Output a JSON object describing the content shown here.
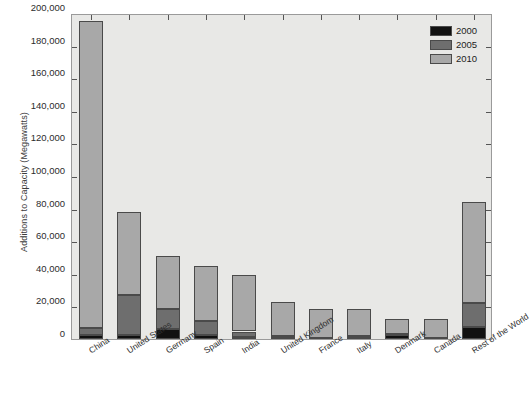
{
  "chart_data": {
    "type": "bar",
    "subtype": "stacked",
    "title": "",
    "xlabel": "",
    "ylabel": "Additions to Capacity (Megawatts)",
    "ylim": [
      0,
      200000
    ],
    "ytick_labels": [
      "0",
      "20,000",
      "40,000",
      "60,000",
      "80,000",
      "100,000",
      "120,000",
      "140,000",
      "160,000",
      "180,000",
      "200,000"
    ],
    "ytick_values": [
      0,
      20000,
      40000,
      60000,
      80000,
      100000,
      120000,
      140000,
      160000,
      180000,
      200000
    ],
    "grid": false,
    "legend_position": "top-right",
    "categories": [
      "China",
      "United States",
      "Germany",
      "Spain",
      "India",
      "United Kingdom",
      "France",
      "Italy",
      "Denmark",
      "Canada",
      "Rest of the World"
    ],
    "series": [
      {
        "name": "2000",
        "color": "#111111",
        "values": [
          2500,
          2500,
          6100,
          2200,
          1200,
          400,
          100,
          400,
          2400,
          150,
          7400
        ]
      },
      {
        "name": "2005",
        "color": "#6e6e6e",
        "values": [
          4000,
          24500,
          12300,
          8900,
          3400,
          1300,
          800,
          1300,
          800,
          500,
          14600
        ]
      },
      {
        "name": "2010",
        "color": "#a8a8a8",
        "values": [
          188500,
          51000,
          32600,
          33900,
          34400,
          21300,
          17600,
          16800,
          9300,
          11350,
          62000
        ]
      }
    ],
    "totals": [
      195000,
      78000,
      51000,
      45000,
      39000,
      23000,
      18500,
      18500,
      12500,
      12000,
      84000
    ]
  },
  "legend": {
    "items": [
      {
        "label": "2000",
        "color": "#111111"
      },
      {
        "label": "2005",
        "color": "#6e6e6e"
      },
      {
        "label": "2010",
        "color": "#a8a8a8"
      }
    ]
  },
  "style": {
    "plot_background": "#e8e8e6",
    "axis_color": "#9a9a9a",
    "page_background": "#ffffff"
  }
}
